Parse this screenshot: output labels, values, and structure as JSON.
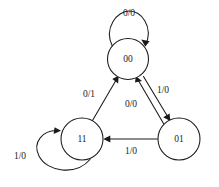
{
  "diagram": {
    "background_color": "#ffffff",
    "stroke_color": "#1a1a1a",
    "states": [
      {
        "id": "s00",
        "label": "00",
        "cx": 128,
        "cy": 59,
        "r": 20.5
      },
      {
        "id": "s11",
        "label": "11",
        "cx": 82,
        "cy": 139,
        "r": 21.0
      },
      {
        "id": "s01",
        "label": "01",
        "cx": 179,
        "cy": 139,
        "r": 21.0
      }
    ],
    "transitions": [
      {
        "id": "t-00-00",
        "from": "00",
        "to": "00",
        "label": "0/0",
        "kind": "self-loop",
        "label_x": 129,
        "label_y": 14
      },
      {
        "id": "t-11-00",
        "from": "11",
        "to": "00",
        "label": "0/1",
        "kind": "edge",
        "label_x": 89,
        "label_y": 95
      },
      {
        "id": "t-01-00",
        "from": "01",
        "to": "00",
        "label": "0/0",
        "kind": "edge",
        "label_x": 131,
        "label_y": 105
      },
      {
        "id": "t-00-01",
        "from": "00",
        "to": "01",
        "label": "1/0",
        "kind": "edge",
        "label_x": 163,
        "label_y": 91
      },
      {
        "id": "t-01-11",
        "from": "01",
        "to": "11",
        "label": "1/0",
        "kind": "edge",
        "label_x": 131,
        "label_y": 152
      },
      {
        "id": "t-11-11",
        "from": "11",
        "to": "11",
        "label": "1/0",
        "kind": "self-loop",
        "label_x": 20,
        "label_y": 157
      }
    ]
  }
}
